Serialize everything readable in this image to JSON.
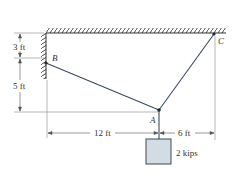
{
  "diagram": {
    "points": {
      "A": "A",
      "B": "B",
      "C": "C"
    },
    "dimensions": {
      "vertical_top": "3 ft",
      "vertical_bottom": "5 ft",
      "horizontal_left": "12 ft",
      "horizontal_right": "6 ft"
    },
    "load": "2 kips",
    "colors": {
      "line": "#3a4a5e",
      "hatch": "#333333",
      "box_fill": "#d3dbe3",
      "dim_line": "#777777"
    }
  }
}
